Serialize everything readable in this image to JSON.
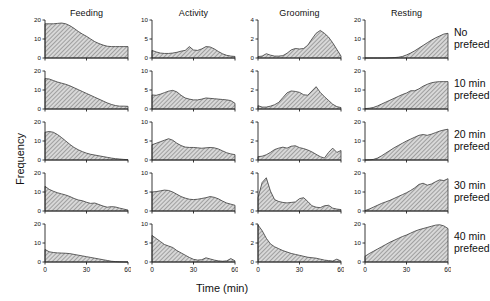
{
  "figure": {
    "xlabel": "Time (min)",
    "ylabel": "Frequency"
  },
  "columns": [
    {
      "label": "Feeding",
      "ymax": 20,
      "yticks": [
        0,
        10,
        20
      ]
    },
    {
      "label": "Activity",
      "ymax": 10,
      "yticks": [
        0,
        5,
        10
      ]
    },
    {
      "label": "Grooming",
      "ymax": 4,
      "yticks": [
        0,
        2,
        4
      ]
    },
    {
      "label": "Resting",
      "ymax": 20,
      "yticks": [
        0,
        10,
        20
      ]
    }
  ],
  "rows": [
    {
      "label_line1": "No",
      "label_line2": "prefeed"
    },
    {
      "label_line1": "10 min",
      "label_line2": "prefeed"
    },
    {
      "label_line1": "20 min",
      "label_line2": "prefeed"
    },
    {
      "label_line1": "30 min",
      "label_line2": "prefeed"
    },
    {
      "label_line1": "40 min",
      "label_line2": "prefeed"
    }
  ],
  "chart_data": {
    "type": "area",
    "title": "",
    "xlabel": "Time (min)",
    "ylabel": "Frequency",
    "xlim": [
      0,
      60
    ],
    "xticks": [
      0,
      30,
      60
    ],
    "grid": false,
    "legend": "none",
    "fill": "hatched-gray",
    "panel_grid": {
      "rows": 5,
      "cols": 4
    },
    "row_labels": [
      "No prefeed",
      "10 min prefeed",
      "20 min prefeed",
      "30 min prefeed",
      "40 min prefeed"
    ],
    "col_labels": [
      "Feeding",
      "Activity",
      "Grooming",
      "Resting"
    ],
    "panels": [
      {
        "row": "No prefeed",
        "column": "Feeding",
        "ylim": [
          0,
          20
        ],
        "yticks": [
          0,
          10,
          20
        ],
        "x": [
          0,
          3,
          6,
          9,
          12,
          15,
          18,
          21,
          24,
          27,
          30,
          33,
          36,
          39,
          42,
          45,
          48,
          51,
          54,
          57,
          60
        ],
        "y": [
          18.0,
          18.0,
          18.0,
          18.2,
          18.4,
          18.0,
          17.0,
          15.6,
          14.0,
          12.6,
          11.4,
          10.0,
          8.6,
          7.6,
          6.8,
          6.2,
          6.0,
          6.0,
          6.0,
          6.0,
          6.0
        ]
      },
      {
        "row": "No prefeed",
        "column": "Activity",
        "ylim": [
          0,
          10
        ],
        "yticks": [
          0,
          5,
          10
        ],
        "x": [
          0,
          3,
          6,
          9,
          12,
          15,
          18,
          21,
          24,
          27,
          30,
          33,
          36,
          39,
          42,
          45,
          48,
          51,
          54,
          57,
          60
        ],
        "y": [
          2.0,
          1.6,
          1.3,
          1.2,
          1.2,
          1.3,
          1.5,
          1.8,
          2.0,
          3.0,
          2.1,
          2.0,
          2.4,
          3.0,
          2.9,
          2.4,
          1.7,
          1.1,
          0.7,
          0.5,
          0.4
        ]
      },
      {
        "row": "No prefeed",
        "column": "Grooming",
        "ylim": [
          0,
          4
        ],
        "yticks": [
          0,
          2,
          4
        ],
        "x": [
          0,
          3,
          6,
          9,
          12,
          15,
          18,
          21,
          24,
          27,
          30,
          33,
          36,
          39,
          42,
          45,
          48,
          51,
          54,
          57,
          60
        ],
        "y": [
          0.15,
          0.2,
          0.45,
          0.3,
          0.2,
          0.2,
          0.25,
          0.5,
          0.85,
          1.0,
          0.95,
          1.0,
          1.35,
          2.0,
          2.6,
          2.9,
          2.6,
          2.2,
          1.6,
          0.9,
          0.2
        ]
      },
      {
        "row": "No prefeed",
        "column": "Resting",
        "ylim": [
          0,
          20
        ],
        "yticks": [
          0,
          10,
          20
        ],
        "x": [
          0,
          3,
          6,
          9,
          12,
          15,
          18,
          21,
          24,
          27,
          30,
          33,
          36,
          39,
          42,
          45,
          48,
          51,
          54,
          57,
          60
        ],
        "y": [
          0.0,
          0.0,
          0.0,
          0.0,
          0.0,
          0.0,
          0.1,
          0.2,
          0.4,
          0.8,
          1.6,
          2.6,
          3.8,
          5.2,
          6.6,
          8.0,
          9.4,
          10.6,
          11.6,
          12.6,
          13.0
        ]
      },
      {
        "row": "10 min prefeed",
        "column": "Feeding",
        "ylim": [
          0,
          20
        ],
        "yticks": [
          0,
          10,
          20
        ],
        "x": [
          0,
          3,
          6,
          9,
          12,
          15,
          18,
          21,
          24,
          27,
          30,
          33,
          36,
          39,
          42,
          45,
          48,
          51,
          54,
          57,
          60
        ],
        "y": [
          16.0,
          15.8,
          15.0,
          14.2,
          13.6,
          13.0,
          12.2,
          11.2,
          10.2,
          9.2,
          8.2,
          7.2,
          6.2,
          5.2,
          4.2,
          3.2,
          2.4,
          1.8,
          1.5,
          1.5,
          1.4
        ]
      },
      {
        "row": "10 min prefeed",
        "column": "Activity",
        "ylim": [
          0,
          10
        ],
        "yticks": [
          0,
          5,
          10
        ],
        "x": [
          0,
          3,
          6,
          9,
          12,
          15,
          18,
          21,
          24,
          27,
          30,
          33,
          36,
          39,
          42,
          45,
          48,
          51,
          54,
          57,
          60
        ],
        "y": [
          3.7,
          3.6,
          3.9,
          4.3,
          4.7,
          4.9,
          4.5,
          3.6,
          2.9,
          2.6,
          2.4,
          2.4,
          2.6,
          2.9,
          2.8,
          2.7,
          2.6,
          2.5,
          2.4,
          2.2,
          1.5
        ]
      },
      {
        "row": "10 min prefeed",
        "column": "Grooming",
        "ylim": [
          0,
          4
        ],
        "yticks": [
          0,
          2,
          4
        ],
        "x": [
          0,
          3,
          6,
          9,
          12,
          15,
          18,
          21,
          24,
          27,
          30,
          33,
          36,
          39,
          42,
          45,
          48,
          51,
          54,
          57,
          60
        ],
        "y": [
          0.35,
          0.2,
          0.2,
          0.3,
          0.45,
          0.7,
          1.2,
          1.7,
          1.9,
          1.85,
          1.75,
          1.5,
          1.45,
          1.9,
          2.35,
          1.75,
          1.3,
          0.9,
          0.5,
          0.25,
          0.15
        ]
      },
      {
        "row": "10 min prefeed",
        "column": "Resting",
        "ylim": [
          0,
          20
        ],
        "yticks": [
          0,
          10,
          20
        ],
        "x": [
          0,
          3,
          6,
          9,
          12,
          15,
          18,
          21,
          24,
          27,
          30,
          33,
          36,
          39,
          42,
          45,
          48,
          51,
          54,
          57,
          60
        ],
        "y": [
          0.2,
          0.4,
          0.8,
          1.6,
          2.6,
          3.6,
          4.6,
          5.6,
          6.6,
          7.6,
          8.4,
          9.6,
          9.6,
          10.6,
          12.0,
          13.0,
          13.8,
          14.2,
          14.4,
          14.4,
          14.4
        ]
      },
      {
        "row": "20 min prefeed",
        "column": "Feeding",
        "ylim": [
          0,
          20
        ],
        "yticks": [
          0,
          10,
          20
        ],
        "x": [
          0,
          3,
          6,
          9,
          12,
          15,
          18,
          21,
          24,
          27,
          30,
          33,
          36,
          39,
          42,
          45,
          48,
          51,
          54,
          57,
          60
        ],
        "y": [
          14.6,
          15.0,
          14.6,
          13.4,
          11.8,
          10.0,
          8.2,
          6.6,
          5.4,
          4.4,
          3.6,
          3.0,
          2.6,
          2.2,
          1.8,
          1.4,
          1.0,
          0.7,
          0.5,
          0.3,
          0.2
        ]
      },
      {
        "row": "20 min prefeed",
        "column": "Activity",
        "ylim": [
          0,
          10
        ],
        "yticks": [
          0,
          5,
          10
        ],
        "x": [
          0,
          3,
          6,
          9,
          12,
          15,
          18,
          21,
          24,
          27,
          30,
          33,
          36,
          39,
          42,
          45,
          48,
          51,
          54,
          57,
          60
        ],
        "y": [
          4.0,
          4.4,
          4.8,
          5.2,
          5.6,
          5.2,
          4.4,
          3.8,
          3.4,
          3.3,
          3.3,
          3.2,
          3.1,
          3.2,
          3.3,
          3.2,
          2.9,
          2.4,
          1.9,
          1.6,
          1.4
        ]
      },
      {
        "row": "20 min prefeed",
        "column": "Grooming",
        "ylim": [
          0,
          4
        ],
        "yticks": [
          0,
          2,
          4
        ],
        "x": [
          0,
          3,
          6,
          9,
          12,
          15,
          18,
          21,
          24,
          27,
          30,
          33,
          36,
          39,
          42,
          45,
          48,
          51,
          54,
          57,
          60
        ],
        "y": [
          0.35,
          0.4,
          0.55,
          0.8,
          1.1,
          1.25,
          1.35,
          1.25,
          1.45,
          1.5,
          1.3,
          1.2,
          1.05,
          0.85,
          0.6,
          0.35,
          0.2,
          0.8,
          1.25,
          0.8,
          1.0
        ]
      },
      {
        "row": "20 min prefeed",
        "column": "Resting",
        "ylim": [
          0,
          20
        ],
        "yticks": [
          0,
          10,
          20
        ],
        "x": [
          0,
          3,
          6,
          9,
          12,
          15,
          18,
          21,
          24,
          27,
          30,
          33,
          36,
          39,
          42,
          45,
          48,
          51,
          54,
          57,
          60
        ],
        "y": [
          0.0,
          0.1,
          0.3,
          1.0,
          2.2,
          3.6,
          5.0,
          6.4,
          7.6,
          8.8,
          10.0,
          11.0,
          12.0,
          13.0,
          13.4,
          13.0,
          13.6,
          14.4,
          15.2,
          15.8,
          16.2
        ]
      },
      {
        "row": "30 min prefeed",
        "column": "Feeding",
        "ylim": [
          0,
          20
        ],
        "yticks": [
          0,
          10,
          20
        ],
        "x": [
          0,
          3,
          6,
          9,
          12,
          15,
          18,
          21,
          24,
          27,
          30,
          33,
          36,
          39,
          42,
          45,
          48,
          51,
          54,
          57,
          60
        ],
        "y": [
          13.0,
          11.4,
          10.4,
          9.6,
          9.0,
          8.4,
          7.6,
          6.6,
          5.8,
          5.4,
          4.6,
          4.0,
          4.2,
          3.4,
          2.6,
          2.0,
          2.3,
          2.1,
          1.5,
          1.0,
          0.5
        ]
      },
      {
        "row": "30 min prefeed",
        "column": "Activity",
        "ylim": [
          0,
          10
        ],
        "yticks": [
          0,
          5,
          10
        ],
        "x": [
          0,
          3,
          6,
          9,
          12,
          15,
          18,
          21,
          24,
          27,
          30,
          33,
          36,
          39,
          42,
          45,
          48,
          51,
          54,
          57,
          60
        ],
        "y": [
          5.0,
          5.1,
          5.3,
          5.5,
          5.4,
          5.0,
          4.4,
          3.8,
          3.4,
          3.1,
          3.0,
          3.1,
          3.3,
          3.5,
          3.8,
          3.6,
          3.2,
          2.6,
          2.1,
          1.8,
          1.5
        ]
      },
      {
        "row": "30 min prefeed",
        "column": "Grooming",
        "ylim": [
          0,
          4
        ],
        "yticks": [
          0,
          2,
          4
        ],
        "x": [
          0,
          3,
          6,
          9,
          12,
          15,
          18,
          21,
          24,
          27,
          30,
          33,
          36,
          39,
          42,
          45,
          48,
          51,
          54,
          57,
          60
        ],
        "y": [
          1.4,
          3.0,
          3.5,
          2.1,
          1.2,
          1.0,
          0.9,
          0.85,
          0.9,
          0.95,
          1.3,
          1.4,
          1.0,
          0.55,
          0.4,
          0.35,
          0.55,
          0.6,
          0.3,
          0.2,
          0.15
        ]
      },
      {
        "row": "30 min prefeed",
        "column": "Resting",
        "ylim": [
          0,
          20
        ],
        "yticks": [
          0,
          10,
          20
        ],
        "x": [
          0,
          3,
          6,
          9,
          12,
          15,
          18,
          21,
          24,
          27,
          30,
          33,
          36,
          39,
          42,
          45,
          48,
          51,
          54,
          57,
          60
        ],
        "y": [
          0.2,
          1.0,
          2.0,
          3.0,
          4.0,
          4.8,
          5.6,
          6.6,
          7.6,
          8.6,
          9.6,
          10.8,
          12.2,
          14.0,
          14.6,
          13.6,
          14.2,
          15.4,
          16.4,
          16.0,
          17.0
        ]
      },
      {
        "row": "40 min prefeed",
        "column": "Feeding",
        "ylim": [
          0,
          20
        ],
        "yticks": [
          0,
          10,
          20
        ],
        "x": [
          0,
          3,
          6,
          9,
          12,
          15,
          18,
          21,
          24,
          27,
          30,
          33,
          36,
          39,
          42,
          45,
          48,
          51,
          54,
          57,
          60
        ],
        "y": [
          6.6,
          5.4,
          5.0,
          4.8,
          4.7,
          4.6,
          4.4,
          4.0,
          3.6,
          3.2,
          2.8,
          2.4,
          2.0,
          1.6,
          1.2,
          0.8,
          0.4,
          0.2,
          0.1,
          0.05,
          0.0
        ]
      },
      {
        "row": "40 min prefeed",
        "column": "Activity",
        "ylim": [
          0,
          10
        ],
        "yticks": [
          0,
          5,
          10
        ],
        "x": [
          0,
          3,
          6,
          9,
          12,
          15,
          18,
          21,
          24,
          27,
          30,
          33,
          36,
          39,
          42,
          45,
          48,
          51,
          54,
          57,
          60
        ],
        "y": [
          7.0,
          6.2,
          5.4,
          4.6,
          4.2,
          3.8,
          3.0,
          2.4,
          1.8,
          1.2,
          0.7,
          0.5,
          0.6,
          1.1,
          0.8,
          0.5,
          0.3,
          0.2,
          0.3,
          0.9,
          0.3
        ]
      },
      {
        "row": "40 min prefeed",
        "column": "Grooming",
        "ylim": [
          0,
          4
        ],
        "yticks": [
          0,
          2,
          4
        ],
        "x": [
          0,
          3,
          6,
          9,
          12,
          15,
          18,
          21,
          24,
          27,
          30,
          33,
          36,
          39,
          42,
          45,
          48,
          51,
          54,
          57,
          60
        ],
        "y": [
          3.9,
          3.3,
          2.5,
          1.9,
          1.6,
          1.4,
          1.2,
          1.05,
          0.9,
          0.8,
          0.7,
          0.6,
          0.5,
          0.45,
          0.4,
          0.3,
          0.2,
          0.15,
          0.1,
          0.3,
          0.1
        ]
      },
      {
        "row": "40 min prefeed",
        "column": "Resting",
        "ylim": [
          0,
          20
        ],
        "yticks": [
          0,
          10,
          20
        ],
        "x": [
          0,
          3,
          6,
          9,
          12,
          15,
          18,
          21,
          24,
          27,
          30,
          33,
          36,
          39,
          42,
          45,
          48,
          51,
          54,
          57,
          60
        ],
        "y": [
          3.0,
          4.4,
          5.6,
          6.8,
          8.0,
          9.2,
          10.4,
          11.4,
          12.4,
          13.4,
          14.2,
          15.2,
          16.2,
          17.0,
          17.6,
          18.2,
          18.8,
          19.4,
          19.6,
          19.0,
          17.6
        ]
      }
    ]
  }
}
